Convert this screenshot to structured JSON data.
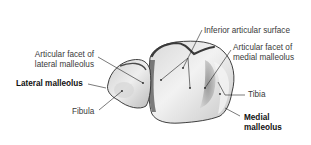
{
  "figure": {
    "labels": [
      {
        "id": "inferior_articular_surface",
        "line1": "Inferior articular surface",
        "line2": "",
        "bold": false
      },
      {
        "id": "articular_facet_lateral",
        "line1": "Articular facet of",
        "line2": "lateral malleolus",
        "bold": false
      },
      {
        "id": "articular_facet_medial",
        "line1": "Articular facet of",
        "line2": "medial malleolus",
        "bold": false
      },
      {
        "id": "lateral_malleolus",
        "line1": "Lateral malleolus",
        "line2": "",
        "bold": true
      },
      {
        "id": "fibula",
        "line1": "Fibula",
        "line2": "",
        "bold": false
      },
      {
        "id": "tibia",
        "line1": "Tibia",
        "line2": "",
        "bold": false
      },
      {
        "id": "medial_malleolus",
        "line1": "Medial",
        "line2": "malleolus",
        "bold": true
      }
    ]
  },
  "colors": {
    "background": "#ffffff",
    "text": "#3a3a3a",
    "text_bold": "#111111",
    "leader": "#222222",
    "bone_light": "#e6e6e6",
    "bone_mid": "#bdbdbd",
    "bone_dark": "#5a5a5a",
    "outline": "#2b2b2b"
  }
}
